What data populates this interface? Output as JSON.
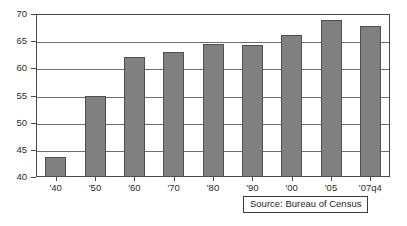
{
  "chart_data": {
    "type": "bar",
    "title": "",
    "subtitle": "",
    "xlabel": "",
    "ylabel": "",
    "categories": [
      "'40",
      "'50",
      "'60",
      "'70",
      "'80",
      "'90",
      "'00",
      "'05",
      "'07q4"
    ],
    "values": [
      43.6,
      55.0,
      62.1,
      63.1,
      64.4,
      64.3,
      66.2,
      68.9,
      67.8
    ],
    "ylim": [
      40,
      70
    ],
    "yticks": [
      40,
      45,
      50,
      55,
      60,
      65,
      70
    ],
    "ytick_labels": [
      "40",
      "45",
      "50",
      "55",
      "60",
      "65",
      "70"
    ],
    "grid": true,
    "grid_axis": "y",
    "legend": null,
    "legend_position": "none",
    "bar_color": "#808080",
    "bar_edge_color": "#4f4f4f",
    "plot_border_color": "#4a4a4a",
    "gridline_color": "#6e6e6e",
    "background_color": "#ffffff",
    "annotations": [
      {
        "name": "source-note",
        "text": "Source: Bureau of Census"
      }
    ]
  },
  "source_note": {
    "text": "Source: Bureau of Census"
  }
}
